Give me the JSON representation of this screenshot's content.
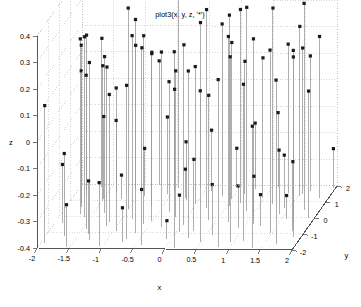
{
  "figure": {
    "title": "plot3(x, y, z, '*')",
    "background_color": "#ffffff",
    "axis_color": "#555555",
    "grid_color": "#bbbbbb",
    "stem_color": "#9a9a9a",
    "marker_color": "#1a1a1a",
    "width": 361,
    "height": 307
  },
  "axes": {
    "x_label": "x",
    "y_label": "y",
    "z_label": "z",
    "x_ticks": [
      "-2",
      "-1.5",
      "-1",
      "-0.5",
      "0",
      "0.5",
      "1",
      "1.5",
      "2"
    ],
    "y_ticks": [
      "-2",
      "-1",
      "0",
      "1",
      "2"
    ],
    "z_ticks": [
      "-0.4",
      "-0.3",
      "-0.2",
      "-0.1",
      "0",
      "0.1",
      "0.2",
      "0.3",
      "0.4"
    ]
  },
  "chart_data": {
    "type": "scatter",
    "title": "plot3(x, y, z, '*')",
    "xlabel": "x",
    "ylabel": "y",
    "zlabel": "z",
    "xlim": [
      -2,
      2
    ],
    "ylim": [
      -2,
      2
    ],
    "zlim": [
      -0.4,
      0.4
    ],
    "xticks": [
      -2,
      -1.5,
      -1,
      -0.5,
      0,
      0.5,
      1,
      1.5,
      2
    ],
    "yticks": [
      -2,
      -1,
      0,
      1,
      2
    ],
    "zticks": [
      -0.4,
      -0.3,
      -0.2,
      -0.1,
      0,
      0.1,
      0.2,
      0.3,
      0.4
    ],
    "grid": true,
    "legend": null,
    "marker": "*",
    "projection": "3d",
    "view": {
      "azimuth": -37.5,
      "elevation": 30
    },
    "series": [
      {
        "name": "z = f(x, y)",
        "points": [
          [
            -1.93,
            -1.71,
            0.12
          ],
          [
            -1.88,
            -0.42,
            -0.18
          ],
          [
            -1.82,
            1.35,
            0.05
          ],
          [
            -1.76,
            0.58,
            0.21
          ],
          [
            -1.71,
            -1.22,
            -0.09
          ],
          [
            -1.66,
            1.84,
            0.16
          ],
          [
            -1.6,
            -0.05,
            0.28
          ],
          [
            -1.55,
            -1.93,
            -0.24
          ],
          [
            -1.49,
            0.96,
            0.11
          ],
          [
            -1.44,
            -0.77,
            0.33
          ],
          [
            -1.38,
            1.52,
            -0.13
          ],
          [
            -1.33,
            0.21,
            0.19
          ],
          [
            -1.27,
            -1.48,
            0.27
          ],
          [
            -1.22,
            1.09,
            -0.31
          ],
          [
            -1.16,
            -0.33,
            0.08
          ],
          [
            -1.11,
            1.71,
            0.24
          ],
          [
            -1.05,
            -1.86,
            -0.16
          ],
          [
            -1.0,
            0.44,
            0.36
          ],
          [
            -0.95,
            -0.91,
            0.14
          ],
          [
            -0.89,
            1.28,
            -0.22
          ],
          [
            -0.84,
            -0.12,
            0.29
          ],
          [
            -0.78,
            1.95,
            0.07
          ],
          [
            -0.73,
            -1.6,
            -0.27
          ],
          [
            -0.67,
            0.67,
            0.18
          ],
          [
            -0.62,
            -1.05,
            0.31
          ],
          [
            -0.56,
            1.43,
            -0.11
          ],
          [
            -0.51,
            -0.24,
            0.23
          ],
          [
            -0.45,
            1.8,
            0.34
          ],
          [
            -0.4,
            -1.77,
            -0.19
          ],
          [
            -0.34,
            0.33,
            0.09
          ],
          [
            -0.29,
            -0.63,
            0.26
          ],
          [
            -0.23,
            1.16,
            -0.29
          ],
          [
            -0.18,
            0.02,
            0.15
          ],
          [
            -0.12,
            1.88,
            0.22
          ],
          [
            -0.07,
            -1.39,
            -0.33
          ],
          [
            -0.01,
            0.79,
            0.12
          ],
          [
            0.04,
            -0.5,
            0.28
          ],
          [
            0.1,
            1.62,
            -0.17
          ],
          [
            0.15,
            -1.95,
            0.2
          ],
          [
            0.21,
            0.55,
            0.35
          ],
          [
            0.26,
            -0.86,
            -0.13
          ],
          [
            0.32,
            1.31,
            0.25
          ],
          [
            0.37,
            -0.17,
            0.07
          ],
          [
            0.43,
            1.99,
            -0.26
          ],
          [
            0.48,
            -1.54,
            0.17
          ],
          [
            0.54,
            0.71,
            0.32
          ],
          [
            0.59,
            -1.1,
            -0.21
          ],
          [
            0.65,
            1.47,
            0.1
          ],
          [
            0.7,
            -0.29,
            0.3
          ],
          [
            0.76,
            1.75,
            -0.15
          ],
          [
            0.81,
            -1.82,
            0.23
          ],
          [
            0.87,
            0.38,
            0.37
          ],
          [
            0.92,
            -0.68,
            -0.24
          ],
          [
            0.98,
            1.2,
            0.13
          ],
          [
            1.03,
            0.07,
            0.27
          ],
          [
            1.09,
            1.92,
            -0.12
          ],
          [
            1.14,
            -1.44,
            0.19
          ],
          [
            1.2,
            0.84,
            0.34
          ],
          [
            1.25,
            -0.55,
            -0.28
          ],
          [
            1.31,
            1.57,
            0.16
          ],
          [
            1.36,
            -1.9,
            0.06
          ],
          [
            1.42,
            0.6,
            -0.2
          ],
          [
            1.47,
            -0.95,
            0.29
          ],
          [
            1.53,
            1.36,
            0.24
          ],
          [
            1.58,
            -0.1,
            -0.31
          ],
          [
            1.64,
            1.67,
            0.11
          ],
          [
            1.69,
            -1.66,
            0.22
          ],
          [
            1.75,
            0.49,
            0.38
          ],
          [
            1.8,
            -0.79,
            -0.14
          ],
          [
            1.86,
            1.24,
            0.21
          ],
          [
            1.91,
            -0.02,
            0.08
          ],
          [
            1.97,
            1.85,
            -0.25
          ],
          [
            -1.7,
            0.15,
            0.26
          ],
          [
            -1.35,
            -1.1,
            -0.2
          ],
          [
            -0.99,
            1.6,
            0.14
          ],
          [
            -0.6,
            -0.45,
            0.31
          ],
          [
            -0.2,
            1.05,
            -0.18
          ],
          [
            0.25,
            -1.3,
            0.23
          ],
          [
            0.68,
            0.9,
            0.33
          ],
          [
            1.12,
            -0.4,
            -0.22
          ],
          [
            1.55,
            1.5,
            0.15
          ],
          [
            1.88,
            -1.2,
            0.28
          ],
          [
            -1.5,
            1.1,
            -0.09
          ],
          [
            -1.15,
            -0.6,
            0.2
          ],
          [
            -0.5,
            1.7,
            0.12
          ],
          [
            0.05,
            -0.95,
            -0.26
          ],
          [
            0.5,
            1.15,
            0.19
          ],
          [
            0.95,
            -1.55,
            0.3
          ],
          [
            1.4,
            0.25,
            -0.16
          ],
          [
            1.72,
            -0.3,
            0.25
          ],
          [
            -1.8,
            0.8,
            0.1
          ],
          [
            -0.7,
            -1.4,
            0.18
          ]
        ]
      }
    ]
  }
}
